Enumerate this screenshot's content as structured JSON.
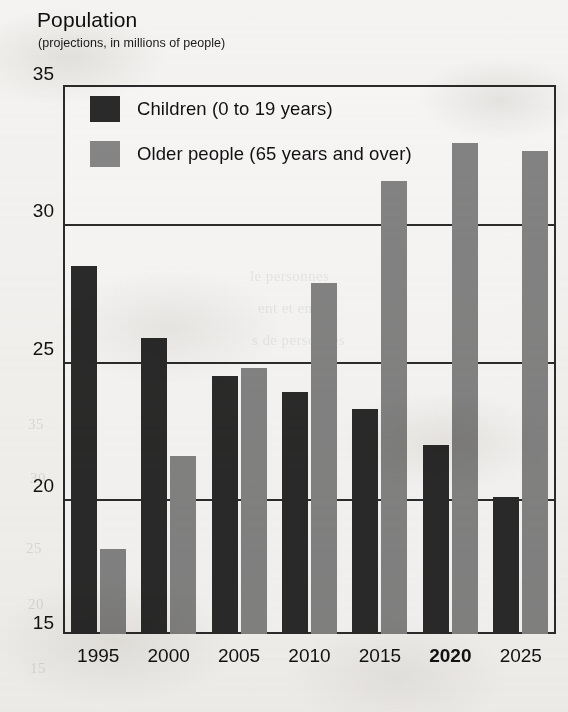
{
  "chart_data": {
    "type": "bar",
    "title": "Population",
    "subtitle": "(projections, in millions of people)",
    "xlabel": "",
    "ylabel": "",
    "ylim": [
      15,
      35
    ],
    "yticks": [
      35,
      30,
      25,
      20,
      15
    ],
    "grid": true,
    "legend_position": "top-left-inside",
    "categories": [
      "1995",
      "2000",
      "2005",
      "2010",
      "2015",
      "2020",
      "2025"
    ],
    "highlighted_category": "2020",
    "series": [
      {
        "name": "Children (0 to 19 years)",
        "color": "#2a2a2a",
        "values": [
          28.4,
          25.8,
          24.4,
          23.8,
          23.2,
          21.9,
          20.0
        ]
      },
      {
        "name": "Older people (65 years and over)",
        "color": "#838383",
        "values": [
          18.1,
          21.5,
          24.7,
          27.8,
          31.5,
          32.9,
          32.6
        ]
      }
    ]
  },
  "ghost_text": [
    {
      "text": "le personnes",
      "left": 250,
      "top": 268
    },
    {
      "text": "ent et en",
      "left": 258,
      "top": 300
    },
    {
      "text": "s de personnes",
      "left": 252,
      "top": 332
    },
    {
      "text": "35",
      "left": 28,
      "top": 416
    },
    {
      "text": "30",
      "left": 30,
      "top": 470
    },
    {
      "text": "25",
      "left": 26,
      "top": 540
    },
    {
      "text": "20",
      "left": 28,
      "top": 596
    },
    {
      "text": "15",
      "left": 30,
      "top": 660
    }
  ]
}
